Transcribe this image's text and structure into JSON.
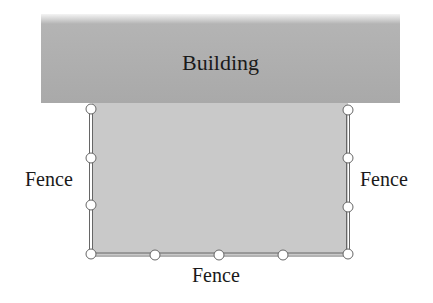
{
  "building": {
    "label": "Building",
    "color": "#a9a9a9"
  },
  "yard": {
    "color": "#c9c9c9"
  },
  "labels": {
    "left": "Fence",
    "right": "Fence",
    "bottom": "Fence"
  },
  "fence": {
    "line_color": "#666666",
    "post_fill": "#ffffff",
    "posts": [
      {
        "x": 91,
        "y": 109
      },
      {
        "x": 91,
        "y": 158
      },
      {
        "x": 91,
        "y": 205
      },
      {
        "x": 91,
        "y": 254
      },
      {
        "x": 155,
        "y": 255
      },
      {
        "x": 219,
        "y": 255
      },
      {
        "x": 283,
        "y": 255
      },
      {
        "x": 348,
        "y": 254
      },
      {
        "x": 348,
        "y": 207
      },
      {
        "x": 348,
        "y": 158
      },
      {
        "x": 348,
        "y": 110
      }
    ]
  }
}
